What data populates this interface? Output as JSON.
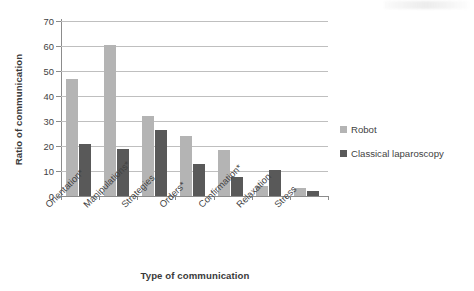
{
  "chart_data": {
    "type": "bar",
    "title": "",
    "xlabel": "Type of communication",
    "ylabel": "Ratio of communication",
    "categories": [
      "Orientation*",
      "Manipulations*",
      "Strategies",
      "Orders*",
      "Confirmation*",
      "Relaxation",
      "Stress"
    ],
    "series": [
      {
        "name": "Robot",
        "color": "#b4b4b4",
        "values": [
          47,
          60.5,
          32,
          24,
          18.5,
          4,
          3.2
        ]
      },
      {
        "name": "Classical laparoscopy",
        "color": "#595959",
        "values": [
          21,
          19,
          26.5,
          13,
          7.5,
          10.5,
          2.2
        ]
      }
    ],
    "ylim": [
      0,
      70
    ],
    "yticks": [
      "0",
      "10",
      "20",
      "30",
      "40",
      "50",
      "60",
      "70"
    ],
    "ytick_values": [
      0,
      10,
      20,
      30,
      40,
      50,
      60,
      70
    ],
    "grid": true,
    "grid_axis": "y",
    "legend_position": "right"
  },
  "legend": {
    "items": [
      {
        "label": "Robot",
        "color": "#b4b4b4"
      },
      {
        "label": "Classical laparoscopy",
        "color": "#595959"
      }
    ]
  },
  "colors": {
    "robot": "#b4b4b4",
    "classical": "#595959",
    "grid": "#bfbfbf",
    "axis": "#8c8c8c",
    "text": "#3f3f3f",
    "background": "#ffffff"
  }
}
